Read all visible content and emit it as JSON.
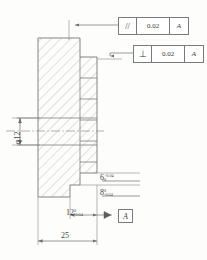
{
  "drawing": {
    "title": "stepped-shaft-cross-section",
    "line_color": "#6f6f6f",
    "hatch_color": "#9a9a9a",
    "text_color": "#444444"
  },
  "feature_control_frames": [
    {
      "id": "parallelism",
      "symbol": "//",
      "symbol_name": "parallelism-symbol",
      "tolerance": "0.02",
      "datum": "A"
    },
    {
      "id": "perpendicularity",
      "symbol": "⊥",
      "symbol_name": "perpendicularity-symbol",
      "tolerance": "0.02",
      "datum": "A"
    }
  ],
  "datum_feature": {
    "label": "A"
  },
  "dimensions": [
    {
      "id": "dim-6",
      "value": "6",
      "upper": "+0.04",
      "lower": "0"
    },
    {
      "id": "dim-8",
      "value": "8",
      "upper": "0",
      "lower": "-0.04"
    },
    {
      "id": "dim-12",
      "value": "12",
      "upper": "0",
      "lower": "-0.04"
    },
    {
      "id": "dim-25",
      "value": "25",
      "upper": "",
      "lower": ""
    },
    {
      "id": "dim-diameter",
      "value": "φ12",
      "upper": "",
      "lower": ""
    }
  ]
}
